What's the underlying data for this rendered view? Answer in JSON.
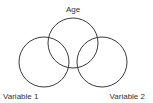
{
  "diagram": {
    "type": "venn",
    "circles": [
      {
        "label": "Age",
        "cx": 73,
        "cy": 43,
        "r": 25
      },
      {
        "label": "Variable 1",
        "cx": 44,
        "cy": 62,
        "r": 25
      },
      {
        "label": "Variable 2",
        "cx": 102,
        "cy": 62,
        "r": 25
      }
    ],
    "labels": {
      "top": "Age",
      "left": "Variable 1",
      "right": "Variable 2"
    },
    "stroke_color": "#3a3a3a",
    "background": "#ffffff"
  }
}
